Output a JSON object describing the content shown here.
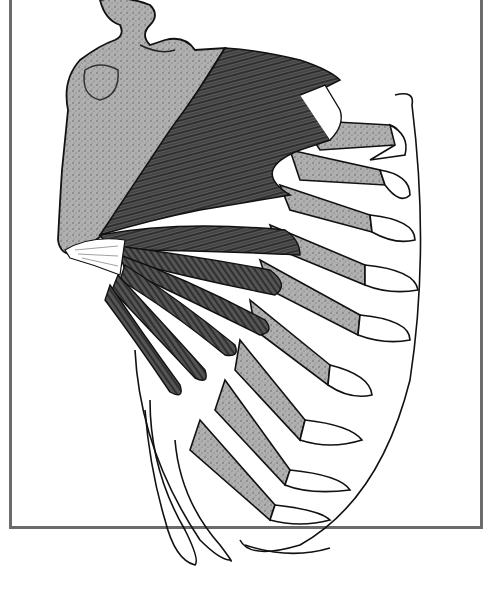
{
  "figure": {
    "labels": [],
    "colors": {
      "background": "#ffffff",
      "frame": "#6b6b6b",
      "bone_stipple": "#a9a9a9",
      "muscle": "#4a4a4a",
      "muscle_fiber": "#1a1a1a",
      "rib_cartilage": "#ffffff",
      "outline": "#111111"
    }
  }
}
